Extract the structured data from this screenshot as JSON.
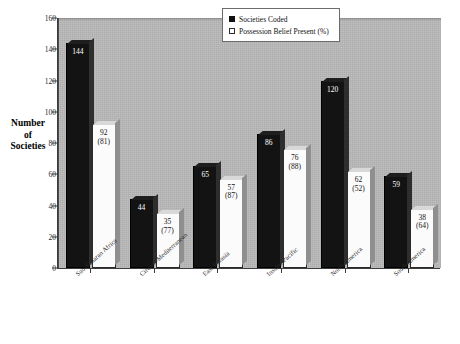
{
  "chart_data": {
    "type": "bar",
    "title": "",
    "subtitle": "",
    "xlabel": "",
    "ylabel": "Number of Societies",
    "ylabel_lines": [
      "Number",
      "of",
      "Societies"
    ],
    "ylim": [
      0,
      160
    ],
    "yticks": [
      0,
      20,
      40,
      60,
      80,
      100,
      120,
      140,
      160
    ],
    "grid": false,
    "legend_position": "top-right",
    "categories": [
      "Sub-Saharan Africa",
      "Circum-Mediterranean",
      "East Eurasia",
      "Insular Pacific",
      "North America",
      "South America"
    ],
    "series": [
      {
        "name": "Societies Coded",
        "color": "#131313",
        "values": [
          144,
          44,
          65,
          86,
          120,
          59
        ],
        "labels": [
          "144",
          "44",
          "65",
          "86",
          "120",
          "59"
        ]
      },
      {
        "name": "Possession Belief Present (%)",
        "color": "#fbfbfb",
        "values": [
          92,
          35,
          57,
          76,
          62,
          38
        ],
        "percents": [
          81,
          77,
          87,
          88,
          52,
          64
        ],
        "labels": [
          "92",
          "35",
          "57",
          "76",
          "62",
          "38"
        ],
        "percent_labels": [
          "(81)",
          "(77)",
          "(87)",
          "(88)",
          "(52)",
          "(64)"
        ]
      }
    ]
  },
  "legend": {
    "items": [
      {
        "label": "Societies Coded",
        "swatch": "filled-black-square"
      },
      {
        "label": "Possession Belief Present (%)",
        "swatch": "open-white-square"
      }
    ]
  },
  "colors": {
    "plot_background": "#b9b9b9",
    "page_background": "#ffffff",
    "axis": "#3c3c3c",
    "series_dark": "#131313",
    "series_light": "#fbfbfb"
  }
}
